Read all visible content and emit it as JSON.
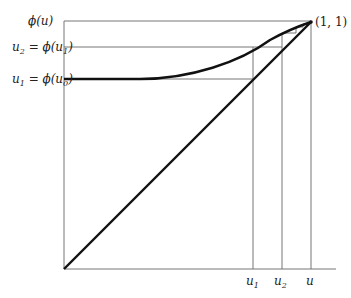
{
  "diagram": {
    "type": "cobweb-fixed-point-iteration",
    "axis_labels": {
      "y_top": "ϕ(u)",
      "x_right": "u"
    },
    "y_tick_labels": [
      {
        "name": "u2",
        "base": "u",
        "sub": "2",
        "eq": " = ϕ(u",
        "sub2": "1",
        "close": ")"
      },
      {
        "name": "u1",
        "base": "u",
        "sub": "1",
        "eq": " = ϕ(u",
        "sub2": "0",
        "close": ")"
      }
    ],
    "x_tick_labels": [
      {
        "base": "u",
        "sub": "1"
      },
      {
        "base": "u",
        "sub": "2"
      },
      {
        "base": "u",
        "sub": ""
      }
    ],
    "point_label": "(1, 1)",
    "colors": {
      "curve": "#111111",
      "thin_line": "#777777",
      "background": "#ffffff"
    }
  }
}
